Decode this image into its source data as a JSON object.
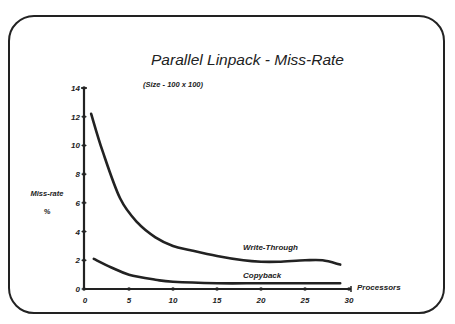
{
  "chart_data": {
    "type": "line",
    "title": "Parallel Linpack - Miss-Rate",
    "subtitle": "(Size - 100 x 100)",
    "xlabel": "Processors",
    "ylabel": "Miss-rate",
    "ylabel_unit": "%",
    "xlim": [
      0,
      30
    ],
    "ylim": [
      0,
      14
    ],
    "x_ticks": [
      0,
      5,
      10,
      15,
      20,
      25,
      30
    ],
    "y_ticks": [
      0,
      2,
      4,
      6,
      8,
      10,
      12,
      14
    ],
    "grid": false,
    "legend": "inline labels",
    "series": [
      {
        "name": "Write-Through",
        "x": [
          0.7,
          2,
          4,
          6,
          8,
          10,
          12,
          15,
          18,
          20,
          22,
          25,
          27,
          29
        ],
        "values": [
          12.2,
          9.6,
          6.3,
          4.6,
          3.6,
          3.0,
          2.7,
          2.3,
          2.0,
          1.9,
          1.9,
          2.0,
          2.0,
          1.7
        ]
      },
      {
        "name": "Copyback",
        "x": [
          1,
          3,
          5,
          8,
          10,
          15,
          20,
          25,
          29
        ],
        "values": [
          2.1,
          1.5,
          1.0,
          0.65,
          0.5,
          0.4,
          0.4,
          0.4,
          0.4
        ]
      }
    ]
  }
}
